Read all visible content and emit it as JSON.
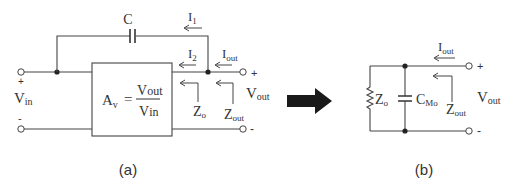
{
  "diagram": {
    "panel_a": {
      "caption": "(a)",
      "capacitor_label": "C",
      "currents": {
        "i1": "I",
        "i1_sub": "1",
        "i2": "I",
        "i2_sub": "2",
        "iout": "I",
        "iout_sub": "out"
      },
      "input": {
        "plus": "+",
        "minus": "-",
        "label": "V",
        "label_sub": "in"
      },
      "output": {
        "plus": "+",
        "minus": "-",
        "label": "V",
        "label_sub": "out"
      },
      "gain_box": {
        "lhs": "A",
        "lhs_sub": "v",
        "eq": "=",
        "num": "V",
        "num_sub": "out",
        "den": "V",
        "den_sub": "in"
      },
      "impedances": {
        "zo": "Z",
        "zo_sub": "o",
        "zout": "Z",
        "zout_sub": "out"
      }
    },
    "transform_arrow": "right-arrow",
    "panel_b": {
      "caption": "(b)",
      "resistor": {
        "label": "Z",
        "label_sub": "o"
      },
      "capacitor": {
        "label": "C",
        "label_sub": "Mo"
      },
      "current": {
        "label": "I",
        "label_sub": "out"
      },
      "impedance": {
        "label": "Z",
        "label_sub": "out"
      },
      "output": {
        "plus": "+",
        "minus": "-",
        "label": "V",
        "label_sub": "out"
      }
    }
  }
}
